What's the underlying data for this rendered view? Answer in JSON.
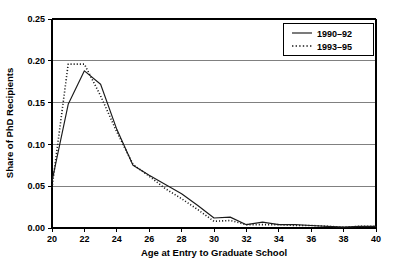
{
  "chart_data": {
    "type": "line",
    "title": "",
    "xlabel": "Age at Entry to Graduate School",
    "ylabel": "Share of PhD Recipients",
    "xlim": [
      20,
      40
    ],
    "ylim": [
      0.0,
      0.25
    ],
    "xticks": [
      20,
      22,
      24,
      26,
      28,
      30,
      32,
      34,
      36,
      38,
      40
    ],
    "xtick_labels": [
      "20",
      "22",
      "24",
      "26",
      "28",
      "30",
      "32",
      "34",
      "36",
      "38",
      "40"
    ],
    "yticks": [
      0.0,
      0.05,
      0.1,
      0.15,
      0.2,
      0.25
    ],
    "ytick_labels": [
      "0.00",
      "0.05",
      "0.10",
      "0.15",
      "0.20",
      "0.25"
    ],
    "grid": "horizontal",
    "legend_position": "top-right",
    "x": [
      20,
      21,
      22,
      23,
      24,
      25,
      26,
      27,
      28,
      29,
      30,
      31,
      32,
      33,
      34,
      35,
      36,
      37,
      38,
      39,
      40
    ],
    "series": [
      {
        "name": "1990–92",
        "style": "solid",
        "color": "#1a1a1a",
        "values": [
          0.056,
          0.148,
          0.188,
          0.172,
          0.118,
          0.075,
          0.063,
          0.052,
          0.041,
          0.027,
          0.012,
          0.013,
          0.004,
          0.007,
          0.004,
          0.004,
          0.003,
          0.002,
          0.001,
          0.002,
          0.002
        ]
      },
      {
        "name": "1993–95",
        "style": "dotted",
        "color": "#1a1a1a",
        "values": [
          0.048,
          0.196,
          0.196,
          0.158,
          0.115,
          0.076,
          0.062,
          0.047,
          0.035,
          0.022,
          0.008,
          0.009,
          0.004,
          0.004,
          0.004,
          0.003,
          0.003,
          0.002,
          0.001,
          0.002,
          0.002
        ]
      }
    ]
  },
  "legend": {
    "items": [
      {
        "label": "1990–92",
        "style": "solid"
      },
      {
        "label": "1993–95",
        "style": "dotted"
      }
    ]
  }
}
